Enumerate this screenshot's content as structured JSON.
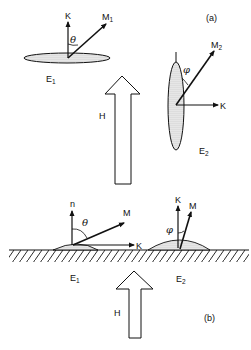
{
  "panel_a": {
    "label": "(a)",
    "ellipse_1": {
      "label": "E",
      "sub": "1",
      "vectors": {
        "normal": "K",
        "magnetization": "M",
        "magnetization_sub": "1",
        "angle": "θ"
      }
    },
    "ellipse_2": {
      "label": "E",
      "sub": "2",
      "vectors": {
        "field_dir": "K",
        "magnetization": "M",
        "magnetization_sub": "2",
        "angle": "φ"
      }
    },
    "field_arrow": {
      "label": "H"
    }
  },
  "panel_b": {
    "label": "(b)",
    "droplet_1": {
      "label": "E",
      "sub": "1",
      "vectors": {
        "normal": "n",
        "magnetization": "M",
        "surface_dir": "K",
        "angle": "θ"
      }
    },
    "droplet_2": {
      "label": "E",
      "sub": "2",
      "vectors": {
        "normal": "K",
        "magnetization": "M",
        "angle": "φ"
      }
    },
    "field_arrow": {
      "label": "H"
    }
  },
  "colors": {
    "ink": "#111111",
    "background": "#ffffff",
    "stipple": "#9a9a9a"
  }
}
